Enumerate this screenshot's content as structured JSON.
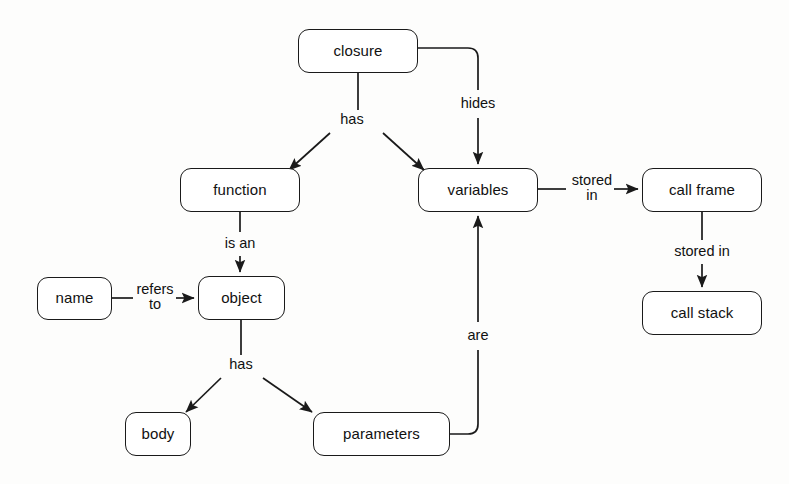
{
  "diagram": {
    "type": "concept-map",
    "background_color": "#fdfdfc",
    "stroke_color": "#1a1a1a",
    "text_color": "#111111",
    "nodes": [
      {
        "id": "closure",
        "label": "closure",
        "x": 298,
        "y": 29,
        "w": 120,
        "h": 44
      },
      {
        "id": "function",
        "label": "function",
        "x": 180,
        "y": 168,
        "w": 120,
        "h": 44
      },
      {
        "id": "variables",
        "label": "variables",
        "x": 418,
        "y": 168,
        "w": 120,
        "h": 44
      },
      {
        "id": "callframe",
        "label": "call frame",
        "x": 642,
        "y": 168,
        "w": 120,
        "h": 44
      },
      {
        "id": "callstack",
        "label": "call stack",
        "x": 642,
        "y": 291,
        "w": 120,
        "h": 44
      },
      {
        "id": "name",
        "label": "name",
        "x": 37,
        "y": 277,
        "w": 75,
        "h": 43
      },
      {
        "id": "object",
        "label": "object",
        "x": 198,
        "y": 276,
        "w": 87,
        "h": 44
      },
      {
        "id": "body",
        "label": "body",
        "x": 125,
        "y": 412,
        "w": 66,
        "h": 44
      },
      {
        "id": "parameters",
        "label": "parameters",
        "x": 313,
        "y": 412,
        "w": 137,
        "h": 44
      }
    ],
    "edges": [
      {
        "id": "closure-has",
        "from": "closure",
        "to": "function",
        "label": "has",
        "lx": 352,
        "ly": 120
      },
      {
        "id": "closure-has-2",
        "from": "closure",
        "to": "variables",
        "label": "",
        "lx": 0,
        "ly": 0
      },
      {
        "id": "closure-hides",
        "from": "closure",
        "to": "variables",
        "label": "hides",
        "lx": 478,
        "ly": 104
      },
      {
        "id": "function-is-an",
        "from": "function",
        "to": "object",
        "label": "is an",
        "lx": 240,
        "ly": 244
      },
      {
        "id": "name-refers-to",
        "from": "name",
        "to": "object",
        "label": "refers\nto",
        "lx": 155,
        "ly": 297
      },
      {
        "id": "object-has",
        "from": "object",
        "to": "body",
        "label": "has",
        "lx": 241,
        "ly": 365
      },
      {
        "id": "object-has-2",
        "from": "object",
        "to": "parameters",
        "label": "",
        "lx": 0,
        "ly": 0
      },
      {
        "id": "parameters-are",
        "from": "parameters",
        "to": "variables",
        "label": "are",
        "lx": 478,
        "ly": 336
      },
      {
        "id": "variables-stored-in",
        "from": "variables",
        "to": "callframe",
        "label": "stored\nin",
        "lx": 592,
        "ly": 188
      },
      {
        "id": "callframe-stored-in",
        "from": "callframe",
        "to": "callstack",
        "label": "stored in",
        "lx": 702,
        "ly": 252
      }
    ]
  }
}
